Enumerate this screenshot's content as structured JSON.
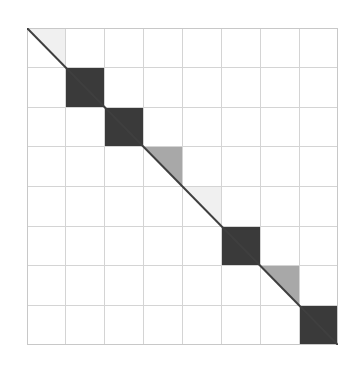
{
  "figure": {
    "title": "",
    "background_color": "#ffffff",
    "width": 357,
    "height": 372
  },
  "plot": {
    "left": 27,
    "top": 28,
    "width": 311,
    "height": 317,
    "border_color": "#c8c8c8",
    "grid_color": "#d4d4d4",
    "grid_visible": true,
    "grid_divisions": 8,
    "diagonal_line_color": "#3f3f3f",
    "diagonal_line_width": 2.0,
    "background_color": "#ffffff"
  },
  "palette": {
    "dark": "#3a3a3a",
    "medium_gray": "#a8a8a8",
    "very_light_gray": "#f0f0f0",
    "white": "#ffffff",
    "grid": "#d4d4d4",
    "border": "#c8c8c8",
    "diagonal": "#3f3f3f"
  },
  "chart_data": {
    "type": "heatmap",
    "title": "",
    "subtitle": "",
    "xlabel": "",
    "ylabel": "",
    "xlim": [
      0,
      8
    ],
    "ylim": [
      0,
      8
    ],
    "grid": true,
    "legend": "none",
    "n_rows": 8,
    "n_cols": 8,
    "categories": [
      "1",
      "2",
      "3",
      "4",
      "5",
      "6",
      "7",
      "8"
    ],
    "value_scale": {
      "white": 0.0,
      "very_light_gray": 0.06,
      "medium_gray": 0.35,
      "dark": 0.78
    },
    "blocks": [
      {
        "index": 0,
        "row": 0,
        "col": 0,
        "color": "#f0f0f0",
        "value": 0.06,
        "shape": "upper-triangle",
        "label": "block-1"
      },
      {
        "index": 1,
        "row": 1,
        "col": 1,
        "color": "#3a3a3a",
        "value": 0.78,
        "shape": "full",
        "label": "block-2"
      },
      {
        "index": 2,
        "row": 2,
        "col": 2,
        "color": "#3a3a3a",
        "value": 0.78,
        "shape": "full",
        "label": "block-3"
      },
      {
        "index": 3,
        "row": 3,
        "col": 3,
        "color": "#a8a8a8",
        "value": 0.35,
        "shape": "upper-triangle",
        "label": "block-4"
      },
      {
        "index": 4,
        "row": 4,
        "col": 4,
        "color": "#f0f0f0",
        "value": 0.06,
        "shape": "upper-triangle",
        "label": "block-5"
      },
      {
        "index": 5,
        "row": 5,
        "col": 5,
        "color": "#3a3a3a",
        "value": 0.78,
        "shape": "full",
        "label": "block-6"
      },
      {
        "index": 6,
        "row": 6,
        "col": 6,
        "color": "#a8a8a8",
        "value": 0.35,
        "shape": "upper-triangle",
        "label": "block-7"
      },
      {
        "index": 7,
        "row": 7,
        "col": 7,
        "color": "#3a3a3a",
        "value": 0.78,
        "shape": "full",
        "label": "block-8"
      }
    ],
    "matrix": [
      [
        0.06,
        0,
        0,
        0,
        0,
        0,
        0,
        0
      ],
      [
        0,
        0.78,
        0,
        0,
        0,
        0,
        0,
        0
      ],
      [
        0,
        0,
        0.78,
        0,
        0,
        0,
        0,
        0
      ],
      [
        0,
        0,
        0,
        0.35,
        0,
        0,
        0,
        0
      ],
      [
        0,
        0,
        0,
        0,
        0.06,
        0,
        0,
        0
      ],
      [
        0,
        0,
        0,
        0,
        0,
        0.78,
        0,
        0
      ],
      [
        0,
        0,
        0,
        0,
        0,
        0,
        0.35,
        0
      ],
      [
        0,
        0,
        0,
        0,
        0,
        0,
        0,
        0.78
      ]
    ],
    "xticklabels": [],
    "yticklabels": [],
    "annotations": []
  }
}
